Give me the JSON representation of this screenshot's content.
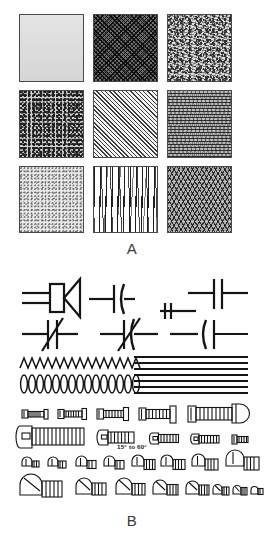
{
  "figure": {
    "page_background": "#fefefe",
    "ink_color": "#141414",
    "panels": [
      {
        "id": "A",
        "label": "A",
        "caption_label": "A",
        "kind": "texture-swatch-grid",
        "columns": 3,
        "rows": 3,
        "swatches": [
          {
            "index": 1,
            "row": 1,
            "col": 1,
            "texture_name": "solid-light-tone",
            "description": "flat light gray tone",
            "tone": "light",
            "base_color": "#dcdcdc"
          },
          {
            "index": 2,
            "row": 1,
            "col": 2,
            "texture_name": "crosshatch-dark",
            "description": "dark fine crosshatch",
            "tone": "dark",
            "base_color": "#6e6e6e"
          },
          {
            "index": 3,
            "row": 1,
            "col": 3,
            "texture_name": "random-noise-coarse",
            "description": "coarse random spatter / noise",
            "tone": "medium",
            "base_color": "#dddddd"
          },
          {
            "index": 4,
            "row": 2,
            "col": 1,
            "texture_name": "stipple-dense",
            "description": "dense medium stipple dots",
            "tone": "medium-dark",
            "base_color": "#d2d2d2"
          },
          {
            "index": 5,
            "row": 2,
            "col": 2,
            "texture_name": "diagonal-hatch-45",
            "description": "45 degree parallel diagonal hatching",
            "tone": "light",
            "base_color": "#f2f2f2"
          },
          {
            "index": 6,
            "row": 2,
            "col": 3,
            "texture_name": "horizontal-wave-lines",
            "description": "horizontal wavy ripple lines",
            "tone": "medium",
            "base_color": "#b9b9b9"
          },
          {
            "index": 7,
            "row": 3,
            "col": 1,
            "texture_name": "stipple-light",
            "description": "fine light stipple dots",
            "tone": "very-light",
            "base_color": "#eaeaea"
          },
          {
            "index": 8,
            "row": 3,
            "col": 2,
            "texture_name": "woodgrain-vertical",
            "description": "vertical wood grain strokes",
            "tone": "light",
            "base_color": "#ffffff"
          },
          {
            "index": 9,
            "row": 3,
            "col": 3,
            "texture_name": "zigzag-dense",
            "description": "dense zigzag chevron weave",
            "tone": "medium-dark",
            "base_color": "#a8a8a8"
          }
        ]
      },
      {
        "id": "B",
        "label": "B",
        "caption_label": "B",
        "kind": "technical-line-drawings",
        "annotation": "15° to 60°",
        "groups": [
          {
            "name": "symbol-row-upper",
            "description": "electrical schematic symbols: horn/transducer, capacitors, polarized capacitors",
            "items": [
              "horn-transducer-symbol",
              "capacitor-curved-symbol",
              "capacitor-symbol",
              "capacitor-pair-symbol"
            ]
          },
          {
            "name": "symbol-row-lower",
            "description": "capacitor symbols with slash/arrow variable markers",
            "items": [
              "variable-capacitor-symbol",
              "variable-capacitor-symbol",
              "capacitor-symbol",
              "capacitor-symbol"
            ]
          },
          {
            "name": "spring-and-line-row",
            "description": "zigzag compression spring, helical coil spring, and bundle of straight ruled lines",
            "items": [
              "zigzag-spring",
              "helical-coil-spring",
              "ruled-line-bundle"
            ]
          },
          {
            "name": "fillister-screw-rows",
            "description": "fillister and pan head machine screws drawn at graduated sizes",
            "items": [
              "fillister-head-screw"
            ]
          },
          {
            "name": "round-head-screw-rows",
            "description": "round head and binding head screws in decreasing sizes",
            "items": [
              "round-head-screw",
              "binding-head-screw"
            ]
          }
        ]
      }
    ]
  }
}
